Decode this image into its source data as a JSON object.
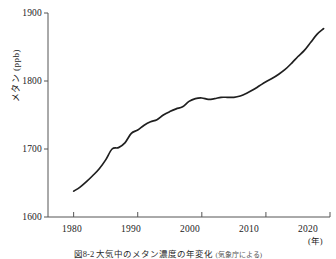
{
  "figure": {
    "caption": "図8-2 大気中のメタン濃度の年変化",
    "caption_source": "(気象庁による)",
    "axis_color": "#555555",
    "line_color": "#1f1f1f"
  },
  "axes": {
    "y_title_main": "メタン",
    "y_title_unit": "(ppb)",
    "x_unit": "(年)",
    "y_ticks": [
      "1600",
      "1700",
      "1800",
      "1900"
    ],
    "x_ticks": [
      "1980",
      "1990",
      "2000",
      "2010",
      "2020"
    ]
  },
  "chart_data": {
    "type": "line",
    "title": "大気中のメタン濃度の年変化",
    "xlabel": "(年)",
    "ylabel": "メタン (ppb)",
    "xlim": [
      1976,
      2020
    ],
    "ylim": [
      1600,
      1900
    ],
    "yticks": [
      1600,
      1700,
      1800,
      1900
    ],
    "xticks": [
      1980,
      1990,
      2000,
      2010,
      2020
    ],
    "grid": false,
    "legend": "none",
    "series": [
      {
        "name": "メタン濃度",
        "units": "ppb",
        "x": [
          1980,
          1981,
          1982,
          1983,
          1984,
          1985,
          1986,
          1987,
          1988,
          1989,
          1990,
          1991,
          1992,
          1993,
          1994,
          1995,
          1996,
          1997,
          1998,
          1999,
          2000,
          2001,
          2002,
          2003,
          2004,
          2005,
          2006,
          2007,
          2008,
          2009,
          2010,
          2011,
          2012,
          2013,
          2014,
          2015,
          2016,
          2017,
          2018,
          2019
        ],
        "values": [
          1638,
          1644,
          1652,
          1661,
          1671,
          1684,
          1700,
          1702,
          1709,
          1723,
          1728,
          1735,
          1740,
          1743,
          1750,
          1755,
          1759,
          1762,
          1770,
          1774,
          1775,
          1773,
          1774,
          1776,
          1776,
          1776,
          1778,
          1782,
          1787,
          1793,
          1799,
          1804,
          1810,
          1817,
          1826,
          1836,
          1845,
          1857,
          1869,
          1877
        ]
      }
    ]
  }
}
